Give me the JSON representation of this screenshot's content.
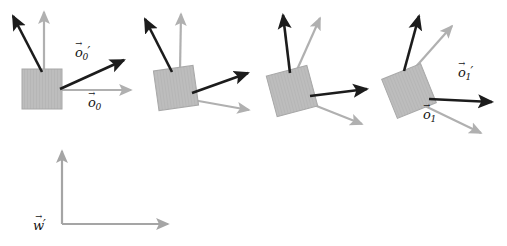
{
  "figure": {
    "background_color": "#ffffff",
    "colors": {
      "dark_arrow": "#1c1c1c",
      "light_arrow": "#b0b0b0",
      "square_fill": "#bdbdbd",
      "square_stroke": "#a8a8a8",
      "label_text": "#141414"
    },
    "stroke_widths": {
      "dark": 2.6,
      "light": 2.2,
      "world": 2.2
    },
    "groups": [
      {
        "name": "group-1",
        "square": {
          "cx": 42,
          "cy": 89,
          "size": 40,
          "rotation_deg": 0
        },
        "dark_arrows": [
          {
            "name": "dark-arrow-up-left",
            "x1": 42,
            "y1": 72,
            "x2": 13,
            "y2": 16
          },
          {
            "name": "dark-arrow-right-up",
            "x1": 60,
            "y1": 89,
            "x2": 124,
            "y2": 60
          }
        ],
        "light_arrows": [
          {
            "name": "light-arrow-up",
            "x1": 44,
            "y1": 72,
            "x2": 44,
            "y2": 12
          },
          {
            "name": "light-arrow-right",
            "x1": 62,
            "y1": 90,
            "x2": 131,
            "y2": 90
          }
        ],
        "labels": [
          {
            "name": "label-o0-prime",
            "base": "o",
            "sub": "0",
            "prime": true
          },
          {
            "name": "label-o0",
            "base": "o",
            "sub": "0",
            "prime": false
          }
        ]
      },
      {
        "name": "group-2",
        "square": {
          "cx": 176,
          "cy": 88,
          "size": 40,
          "rotation_deg": -8
        },
        "dark_arrows": [
          {
            "name": "dark-arrow-up-left",
            "x1": 172,
            "y1": 72,
            "x2": 145,
            "y2": 19
          },
          {
            "name": "dark-arrow-right-up",
            "x1": 192,
            "y1": 93,
            "x2": 248,
            "y2": 73
          }
        ],
        "light_arrows": [
          {
            "name": "light-arrow-up",
            "x1": 180,
            "y1": 71,
            "x2": 181,
            "y2": 14
          },
          {
            "name": "light-arrow-right-down",
            "x1": 193,
            "y1": 100,
            "x2": 249,
            "y2": 110
          }
        ],
        "labels": []
      },
      {
        "name": "group-3",
        "square": {
          "cx": 292,
          "cy": 91,
          "size": 42,
          "rotation_deg": -15
        },
        "dark_arrows": [
          {
            "name": "dark-arrow-up",
            "x1": 290,
            "y1": 73,
            "x2": 283,
            "y2": 15
          },
          {
            "name": "dark-arrow-right",
            "x1": 310,
            "y1": 96,
            "x2": 367,
            "y2": 89
          }
        ],
        "light_arrows": [
          {
            "name": "light-arrow-up-right",
            "x1": 296,
            "y1": 72,
            "x2": 320,
            "y2": 18
          },
          {
            "name": "light-arrow-right-down",
            "x1": 309,
            "y1": 103,
            "x2": 362,
            "y2": 124
          }
        ],
        "labels": []
      },
      {
        "name": "group-4",
        "square": {
          "cx": 409,
          "cy": 91,
          "size": 42,
          "rotation_deg": -22
        },
        "dark_arrows": [
          {
            "name": "dark-arrow-up",
            "x1": 404,
            "y1": 71,
            "x2": 419,
            "y2": 16
          },
          {
            "name": "dark-arrow-right",
            "x1": 429,
            "y1": 99,
            "x2": 492,
            "y2": 102
          }
        ],
        "light_arrows": [
          {
            "name": "light-arrow-up-right",
            "x1": 413,
            "y1": 70,
            "x2": 452,
            "y2": 26
          },
          {
            "name": "light-arrow-right-down",
            "x1": 425,
            "y1": 106,
            "x2": 481,
            "y2": 133
          }
        ],
        "labels": [
          {
            "name": "label-o1-prime",
            "base": "o",
            "sub": "1",
            "prime": true
          },
          {
            "name": "label-o1",
            "base": "o",
            "sub": "1",
            "prime": false
          }
        ]
      }
    ],
    "world_frame": {
      "name": "world-frame",
      "origin": {
        "x": 62,
        "y": 224
      },
      "y_axis": {
        "x1": 62,
        "y1": 224,
        "x2": 62,
        "y2": 151
      },
      "x_axis": {
        "x1": 62,
        "y1": 224,
        "x2": 168,
        "y2": 224
      },
      "label": {
        "name": "label-w-prime",
        "base": "w",
        "prime": true
      }
    }
  },
  "labels": {
    "o0_prime": {
      "base": "o",
      "sub": "0",
      "prime": "′"
    },
    "o0": {
      "base": "o",
      "sub": "0",
      "prime": ""
    },
    "o1_prime": {
      "base": "o",
      "sub": "1",
      "prime": "′"
    },
    "o1": {
      "base": "o",
      "sub": "1",
      "prime": ""
    },
    "w_prime": {
      "base": "w",
      "sub": "",
      "prime": "′"
    }
  }
}
